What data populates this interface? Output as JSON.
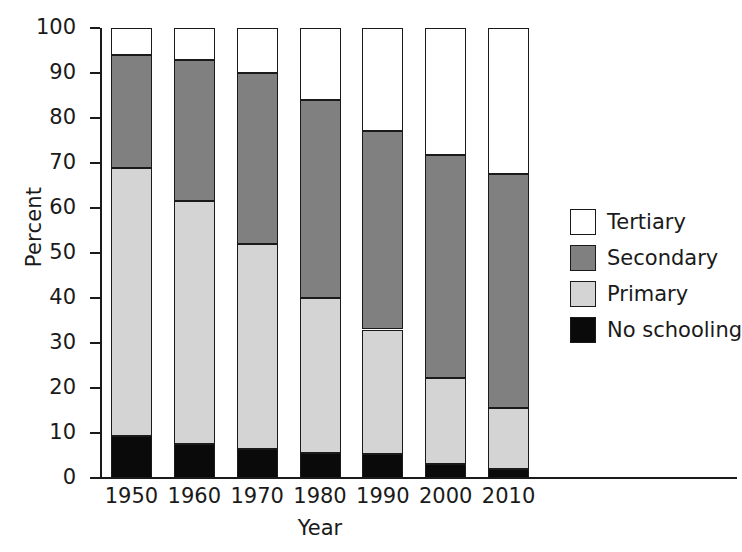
{
  "chart_data": {
    "type": "bar",
    "subtype": "stacked-bar-100",
    "title": "",
    "xlabel": "Year",
    "ylabel": "Percent",
    "categories": [
      "1950",
      "1960",
      "1970",
      "1980",
      "1990",
      "2000",
      "2010"
    ],
    "ylim": [
      0,
      100
    ],
    "yticks": [
      0,
      10,
      20,
      30,
      40,
      50,
      60,
      70,
      80,
      90,
      100
    ],
    "ytick_labels": [
      "0",
      "10",
      "20",
      "30",
      "40",
      "50",
      "60",
      "70",
      "80",
      "90",
      "100"
    ],
    "grid": false,
    "legend_position": "right",
    "stack_order_bottom_to_top": [
      "No schooling",
      "Primary",
      "Secondary",
      "Tertiary"
    ],
    "series": [
      {
        "name": "No schooling",
        "color": "#0a0a0a",
        "values": [
          9.3,
          7.6,
          6.4,
          5.5,
          5.3,
          3.1,
          1.9
        ]
      },
      {
        "name": "Primary",
        "color": "#d4d4d4",
        "values": [
          59.7,
          53.9,
          45.6,
          34.5,
          27.7,
          19.2,
          13.7
        ]
      },
      {
        "name": "Secondary",
        "color": "#808080",
        "values": [
          25.0,
          31.4,
          38.1,
          44.1,
          44.1,
          49.4,
          51.9
        ]
      },
      {
        "name": "Tertiary",
        "color": "#ffffff",
        "values": [
          6.0,
          7.2,
          9.9,
          15.9,
          22.9,
          28.3,
          32.5
        ]
      }
    ],
    "cumulative_tops": {
      "No schooling": [
        9.3,
        7.6,
        6.4,
        5.5,
        5.3,
        3.1,
        1.9
      ],
      "Primary": [
        69.0,
        61.5,
        52.0,
        40.0,
        33.0,
        22.3,
        15.6
      ],
      "Secondary": [
        94.0,
        92.9,
        90.1,
        84.1,
        77.1,
        71.7,
        67.5
      ],
      "Tertiary": [
        100,
        100,
        100,
        100,
        100,
        100,
        100
      ]
    }
  },
  "axes": {
    "ylabel": "Percent",
    "xlabel": "Year"
  },
  "legend": {
    "items": [
      {
        "label": "Tertiary",
        "color": "#ffffff",
        "swatch": "tertiary-swatch"
      },
      {
        "label": "Secondary",
        "color": "#808080",
        "swatch": "secondary-swatch"
      },
      {
        "label": "Primary",
        "color": "#d4d4d4",
        "swatch": "primary-swatch"
      },
      {
        "label": "No schooling",
        "color": "#0a0a0a",
        "swatch": "no-schooling-swatch"
      }
    ]
  }
}
